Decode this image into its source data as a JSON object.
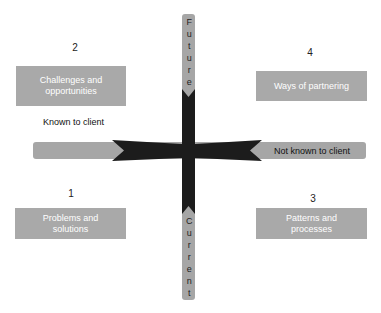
{
  "axes": {
    "top_label": "Future",
    "bottom_label": "Current",
    "left_label": "Known to client",
    "right_label": "Not known to client"
  },
  "quadrants": [
    {
      "number": "1",
      "label": "Problems and solutions",
      "line1": "Problems and",
      "line2": "solutions"
    },
    {
      "number": "2",
      "label": "Challenges and opportunities",
      "line1": "Challenges and",
      "line2": "opportunities"
    },
    {
      "number": "3",
      "label": "Patterns and processes",
      "line1": "Patterns and",
      "line2": "processes"
    },
    {
      "number": "4",
      "label": "Ways of partnering",
      "line1": "Ways of partnering",
      "line2": ""
    }
  ],
  "colors": {
    "bar": "#a6a6a6",
    "box": "#a9a9a9",
    "cross": "#1c1c1c",
    "box_text": "#ffffff"
  }
}
